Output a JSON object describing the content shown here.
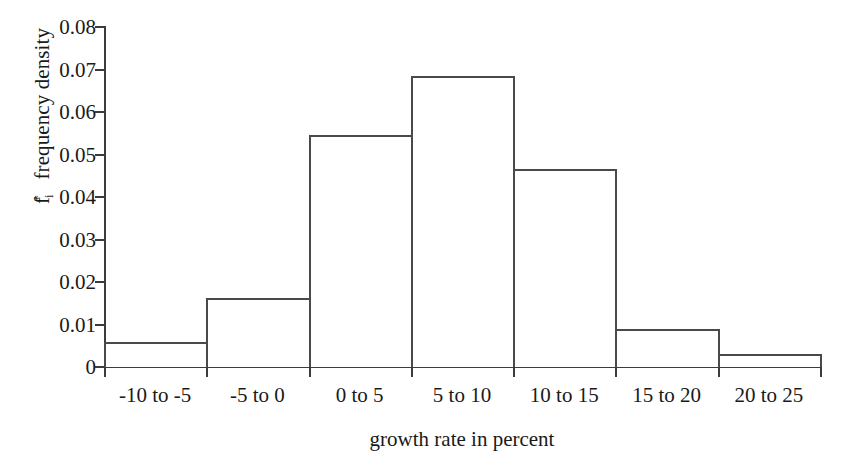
{
  "chart_data": {
    "type": "bar",
    "title": "",
    "subtitle": "",
    "xlabel": "growth rate in percent",
    "ylabel": "f* frequency density",
    "ylabel_parts": {
      "base": "f",
      "subscript": "i",
      "superscript": "*",
      "rest": " frequency density"
    },
    "categories": [
      "-10 to -5",
      "-5 to 0",
      "0 to 5",
      "5 to 10",
      "10 to 15",
      "15 to 20",
      "20 to 25"
    ],
    "values": [
      0.006,
      0.0163,
      0.0545,
      0.0685,
      0.0465,
      0.009,
      0.003
    ],
    "ylim": [
      0,
      0.08
    ],
    "ytick_values": [
      0,
      0.01,
      0.02,
      0.03,
      0.04,
      0.05,
      0.06,
      0.07,
      0.08
    ],
    "ytick_labels": [
      "0",
      "0.01",
      "0.02",
      "0.03",
      "0.04",
      "0.05",
      "0.06",
      "0.07",
      "0.08"
    ],
    "grid": false,
    "legend": null,
    "bar_style": {
      "fill": "#ffffff",
      "edge_color": "#4a4a4a",
      "edge_width_px": 2,
      "gap": 0
    },
    "axis_color": "#3c3c3c",
    "background": "#ffffff"
  }
}
